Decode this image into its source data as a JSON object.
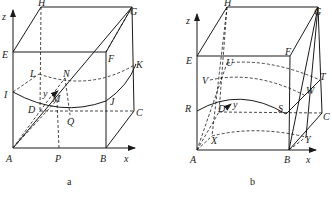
{
  "figures": [
    {
      "id": "a",
      "caption": "a",
      "axes": {
        "z": "z",
        "x": "x",
        "y": "y"
      },
      "points": {
        "H": "H",
        "G": "G",
        "E": "E",
        "F": "F",
        "K": "K",
        "L": "L",
        "N": "N",
        "I": "I",
        "D": "D",
        "M": "M",
        "J": "J",
        "C": "C",
        "Q": "Q",
        "A": "A",
        "P": "P",
        "B": "B"
      }
    },
    {
      "id": "b",
      "caption": "b",
      "axes": {
        "z": "z",
        "x": "x",
        "y": "y"
      },
      "points": {
        "H": "H",
        "G": "G",
        "E": "E",
        "F": "F",
        "U": "U",
        "V": "V",
        "T": "T",
        "W": "W",
        "R": "R",
        "S": "S",
        "D": "D",
        "C": "C",
        "X": "X",
        "Y": "Y",
        "A": "A",
        "B": "B"
      }
    }
  ],
  "colors": {
    "ink": "#1a1a1a",
    "background": "#ffffff"
  }
}
